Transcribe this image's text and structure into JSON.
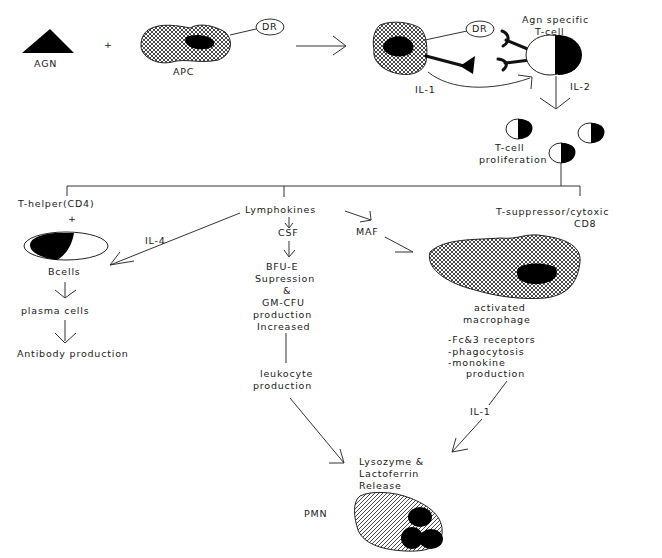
{
  "diagram": {
    "nodes": {
      "agn": "AGN",
      "plus1": "+",
      "apc": "APC",
      "dr1": "DR",
      "dr2": "DR",
      "agn_specific_line1": "Agn specific",
      "agn_specific_line2": "T-cell",
      "il1_top": "IL-1",
      "il2": "IL-2",
      "tcell_prolif_line1": "T-cell",
      "tcell_prolif_line2": "proliferation",
      "t_helper": "T-helper(CD4)",
      "plus2": "+",
      "il4": "IL-4",
      "bcells": "Bcells",
      "plasma_cells": "plasma cells",
      "antibody_production": "Antibody production",
      "lymphokines": "Lymphokines",
      "csf": "CSF",
      "maf": "MAF",
      "bfu_line1": "BFU-E",
      "bfu_line2": "Supression",
      "bfu_line3": "&",
      "bfu_line4": "GM-CFU",
      "bfu_line5": "production",
      "bfu_line6": "Increased",
      "leukocyte_line1": "leukocyte",
      "leukocyte_line2": "production",
      "t_suppressor_line1": "T-suppressor/cytoxic",
      "t_suppressor_line2": "CD8",
      "activated_line1": "activated",
      "activated_line2": "macrophage",
      "effect1": "-Fc&3 receptors",
      "effect2": "-phagocytosis",
      "effect3": "-monokine",
      "effect4": "production",
      "il1_bottom": "IL-1",
      "lysozyme_line1": "Lysozyme &",
      "lysozyme_line2": "Lactoferrin",
      "lysozyme_line3": "Release",
      "pmn": "PMN"
    },
    "colors": {
      "ink": "#1a1a1a",
      "background": "#ffffff"
    }
  }
}
